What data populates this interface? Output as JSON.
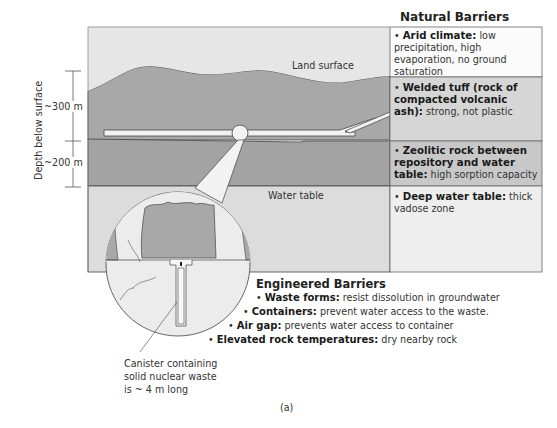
{
  "figure_label": "(a)",
  "labels": {
    "land_surface": "Land surface",
    "water_table": "Water table",
    "depth_axis": "Depth below surface",
    "depth_upper": "~300 m",
    "depth_lower": "~200 m",
    "canister": [
      "Canister containing",
      "solid nuclear waste",
      "is ~ 4 m long"
    ]
  },
  "natural_barriers": {
    "title": "Natural Barriers",
    "items": [
      {
        "bullet": "•",
        "term": "Arid climate:",
        "desc": "low precipitation, high evaporation, no ground saturation"
      },
      {
        "bullet": "•",
        "term": "Welded tuff (rock of compacted volcanic ash):",
        "desc": "strong, not plastic"
      },
      {
        "bullet": "•",
        "term": "Zeolitic rock between repository and water table:",
        "desc": "high sorption capacity"
      },
      {
        "bullet": "•",
        "term": "Deep water table:",
        "desc": "thick vadose zone"
      }
    ]
  },
  "engineered_barriers": {
    "title": "Engineered Barriers",
    "items": [
      {
        "bullet": "•",
        "term": "Waste forms:",
        "desc": "resist dissolution in groundwater"
      },
      {
        "bullet": "•",
        "term": "Containers:",
        "desc": "prevent water access to the waste."
      },
      {
        "bullet": "•",
        "term": "Air gap:",
        "desc": "prevents water access to container"
      },
      {
        "bullet": "•",
        "term": "Elevated rock temperatures:",
        "desc": "dry nearby rock"
      }
    ]
  },
  "colors": {
    "sky": "#e6e6e6",
    "rock": "#a8a8a8",
    "zeolite": "#a3a3a3",
    "saturated": "#dcdcdc",
    "outline": "#444444",
    "tunnel": "#f2f2f2"
  }
}
